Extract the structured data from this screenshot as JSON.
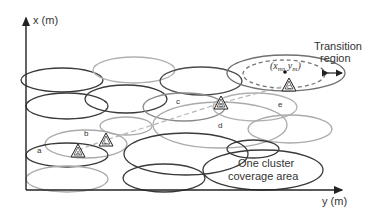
{
  "diagram": {
    "axes": {
      "x_label": "x (m)",
      "y_label": "y (m)"
    },
    "annotations": {
      "transition_region_line1": "Transition",
      "transition_region_line2": "region",
      "cluster_coverage_line1": "One cluster",
      "cluster_coverage_line2": "coverage area",
      "center_point_label": "(x_m, y_m)",
      "center_x": "x",
      "center_x_sub": "m",
      "center_sep": ", ",
      "center_y": "y",
      "center_y_sub": "m"
    },
    "region_labels": {
      "a": "a",
      "b": "b",
      "c": "c",
      "d": "d",
      "e": "e"
    },
    "nodes": {
      "A": "A",
      "L": "L",
      "B": "B",
      "C": "C"
    },
    "colors": {
      "dark": "#3a3a3a",
      "medium": "#777777",
      "light": "#aaaaaa",
      "path_dashed": "#b0b0b0",
      "axis": "#222222"
    }
  }
}
